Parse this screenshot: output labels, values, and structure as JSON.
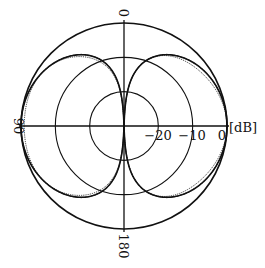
{
  "chart_data": {
    "type": "polar",
    "title": "",
    "radial_unit": "[dB]",
    "radial_ticks": [
      {
        "value": 0,
        "label": "0"
      },
      {
        "value": -10,
        "label": "−10"
      },
      {
        "value": -20,
        "label": "−20"
      }
    ],
    "radial_range": [
      -30,
      0
    ],
    "angle_labels": [
      {
        "angle": 0,
        "label": "0"
      },
      {
        "angle": 90,
        "label": "90"
      },
      {
        "angle": 180,
        "label": "180"
      }
    ],
    "grid": true,
    "series": [
      {
        "name": "measured-1",
        "pattern": "figure-eight",
        "peak_db": 0,
        "null_angles": [
          0,
          180
        ],
        "style": "solid"
      },
      {
        "name": "measured-2",
        "pattern": "figure-eight",
        "peak_db": -0.5,
        "null_angles": [
          0,
          180
        ],
        "style": "dotted"
      },
      {
        "name": "theoretical",
        "pattern": "figure-eight",
        "peak_db": 0,
        "null_angles": [
          0,
          180
        ],
        "style": "solid-thin"
      }
    ]
  },
  "colors": {
    "line": "#111111",
    "background": "#ffffff"
  }
}
